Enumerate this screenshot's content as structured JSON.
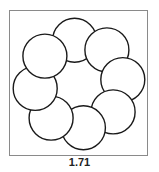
{
  "figure": {
    "caption": "1.71",
    "circle_count": 8,
    "stroke_color": "#1a1a1a",
    "frame_color": "#8a8a8a",
    "fill_color": "#ffffff"
  }
}
